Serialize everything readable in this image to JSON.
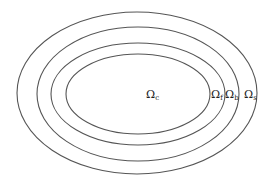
{
  "diagram": {
    "stroke_color": "#555555",
    "background": "#ffffff",
    "ellipses": [
      {
        "name": "outer",
        "cx": 137,
        "cy": 93,
        "rx": 120,
        "ry": 81
      },
      {
        "name": "second",
        "cx": 138,
        "cy": 94,
        "rx": 101,
        "ry": 67
      },
      {
        "name": "third",
        "cx": 138,
        "cy": 94,
        "rx": 87,
        "ry": 51
      },
      {
        "name": "inner",
        "cx": 138,
        "cy": 94,
        "rx": 72,
        "ry": 40
      }
    ],
    "labels": [
      {
        "id": "omega_c",
        "base": "Ω",
        "sub": "c",
        "x": 146,
        "y": 98
      },
      {
        "id": "omega_f",
        "base": "Ω",
        "sub": "f",
        "x": 212,
        "y": 98
      },
      {
        "id": "omega_b",
        "base": "Ω",
        "sub": "b",
        "x": 226,
        "y": 98
      },
      {
        "id": "omega_s",
        "base": "Ω",
        "sub": "s",
        "x": 244,
        "y": 98
      }
    ]
  }
}
